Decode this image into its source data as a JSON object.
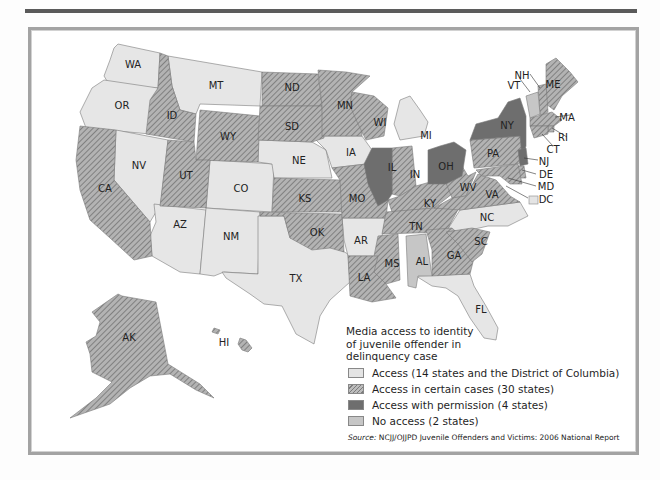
{
  "legend": {
    "title": "Media access to identity of juvenile offender in delinquency case",
    "items": [
      {
        "key": "access",
        "label": "Access (14 states and the District of Columbia)",
        "color": "#e4e4e4"
      },
      {
        "key": "certain",
        "label": "Access in certain cases (30 states)",
        "color": "#9a9a9a",
        "pattern": "hatched"
      },
      {
        "key": "permission",
        "label": "Access with permission (4 states)",
        "color": "#6e6e6e"
      },
      {
        "key": "none",
        "label": "No access (2 states)",
        "color": "#c4c4c4"
      }
    ]
  },
  "source": {
    "prefix": "Source:",
    "text": "NCJJ/OJJPD Juvenile Offenders and Victims: 2006 National Report"
  },
  "states": {
    "access": [
      "WA",
      "OR",
      "MT",
      "NV",
      "CO",
      "AZ",
      "NM",
      "NE",
      "IA",
      "TX",
      "AR",
      "MI",
      "NC",
      "FL",
      "DC"
    ],
    "certain": [
      "ID",
      "WY",
      "ND",
      "SD",
      "MN",
      "WI",
      "UT",
      "CA",
      "KS",
      "OK",
      "MO",
      "IN",
      "KY",
      "TN",
      "MS",
      "LA",
      "GA",
      "SC",
      "WV",
      "VA",
      "PA",
      "ME",
      "NH",
      "MA",
      "RI",
      "CT",
      "DE",
      "MD",
      "AK",
      "HI"
    ],
    "permission": [
      "IL",
      "OH",
      "NY",
      "NJ"
    ],
    "none": [
      "AL",
      "VT"
    ]
  },
  "labels": {
    "WA": "WA",
    "OR": "OR",
    "MT": "MT",
    "ID": "ID",
    "ND": "ND",
    "SD": "SD",
    "WY": "WY",
    "MN": "MN",
    "WI": "WI",
    "MI": "MI",
    "NV": "NV",
    "UT": "UT",
    "CA": "CA",
    "CO": "CO",
    "NE": "NE",
    "IA": "IA",
    "IL": "IL",
    "IN": "IN",
    "OH": "OH",
    "KS": "KS",
    "MO": "MO",
    "KY": "KY",
    "WV": "WV",
    "VA": "VA",
    "PA": "PA",
    "NY": "NY",
    "AZ": "AZ",
    "NM": "NM",
    "OK": "OK",
    "AR": "AR",
    "TN": "TN",
    "NC": "NC",
    "SC": "SC",
    "GA": "GA",
    "AL": "AL",
    "MS": "MS",
    "LA": "LA",
    "TX": "TX",
    "FL": "FL",
    "AK": "AK",
    "HI": "HI",
    "ME": "ME",
    "NH": "NH",
    "VT": "VT",
    "MA": "MA",
    "RI": "RI",
    "CT": "CT",
    "NJ": "NJ",
    "DE": "DE",
    "MD": "MD",
    "DC": "DC"
  }
}
